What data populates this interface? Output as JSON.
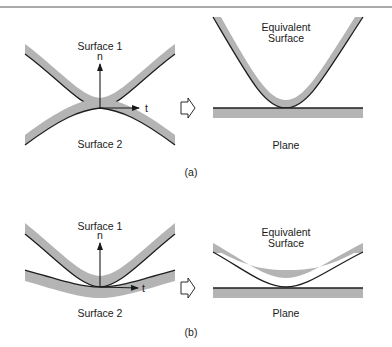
{
  "figure": {
    "panels": [
      {
        "id": "a",
        "caption": "(a)",
        "left": {
          "surface1_label": "Surface 1",
          "surface2_label": "Surface 2",
          "normal_label": "n",
          "tangent_label": "t"
        },
        "right": {
          "equivalent_label_line1": "Equivalent",
          "equivalent_label_line2": "Surface",
          "plane_label": "Plane"
        }
      },
      {
        "id": "b",
        "caption": "(b)",
        "left": {
          "surface1_label": "Surface 1",
          "surface2_label": "Surface 2",
          "normal_label": "n",
          "tangent_label": "t"
        },
        "right": {
          "equivalent_label_line1": "Equivalent",
          "equivalent_label_line2": "Surface",
          "plane_label": "Plane"
        }
      }
    ],
    "transform_arrow_icon": "hollow-right-arrow",
    "colors": {
      "band_fill": "#b4b4b4",
      "band_edge": "#1e1e1e",
      "text": "#1a1a1a",
      "rule": "#555555"
    }
  }
}
